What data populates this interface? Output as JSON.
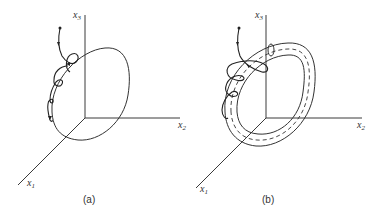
{
  "panels": [
    {
      "id": "a",
      "caption": "(a)",
      "axes": {
        "x1": {
          "label": "x",
          "sub": "1"
        },
        "x2": {
          "label": "x",
          "sub": "2"
        },
        "x3": {
          "label": "x",
          "sub": "3"
        }
      },
      "description": "Trajectory spiraling onto a closed orbit (limit cycle) in 3D phase space"
    },
    {
      "id": "b",
      "caption": "(b)",
      "axes": {
        "x1": {
          "label": "x",
          "sub": "1"
        },
        "x2": {
          "label": "x",
          "sub": "2"
        },
        "x3": {
          "label": "x",
          "sub": "3"
        }
      },
      "description": "Trajectory spiraling around a tube (torus neighborhood) surrounding the closed orbit, shown dashed"
    }
  ],
  "colors": {
    "line": "#333333",
    "background": "#ffffff"
  }
}
